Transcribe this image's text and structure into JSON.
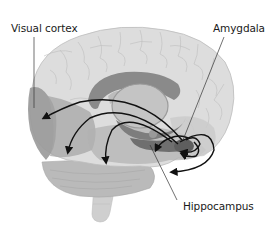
{
  "diagram": {
    "type": "brain-anatomy-illustration",
    "view": "lateral, transparent cortex",
    "labels": [
      {
        "id": "visual-cortex",
        "text": "Visual cortex",
        "anchor": "occipital lobe (rear, left side)"
      },
      {
        "id": "amygdala",
        "text": "Amygdala",
        "anchor": "medial temporal lobe (front, right side)"
      },
      {
        "id": "hippocampus",
        "text": "Hippocampus",
        "anchor": "medial temporal lobe, behind amygdala"
      }
    ],
    "arrows": {
      "description": "Curved black arrows project from the amygdala back to the visual cortex and surrounding temporal/occipital regions, plus short loops within the amygdala-hippocampus complex",
      "count_long_projections": 3,
      "count_local_loops": 4
    },
    "colors": {
      "cortex": "#d9d9d9",
      "sulci": "#bdbdbd",
      "visual_cortex": "#9a9a9a",
      "limbic_structures": "#8c8c8c",
      "cerebellum": "#b5b5b5",
      "brainstem": "#c8c8c8",
      "arrows": "#111111",
      "leader_lines": "#333333",
      "text": "#1a1a1a",
      "background": "#ffffff"
    }
  }
}
